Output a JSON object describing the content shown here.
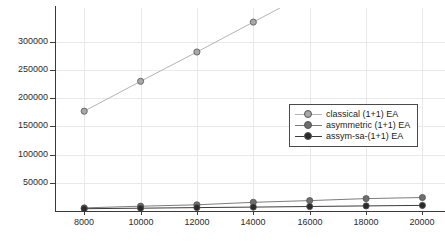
{
  "chart_data": {
    "type": "line",
    "title": "",
    "xlabel": "",
    "ylabel": "",
    "xlim": [
      7000,
      20800
    ],
    "ylim": [
      0,
      360000
    ],
    "xticks": [
      8000,
      10000,
      12000,
      14000,
      16000,
      18000,
      20000
    ],
    "yticks": [
      50000,
      100000,
      150000,
      200000,
      250000,
      300000
    ],
    "xtick_labels": [
      "8000",
      "10000",
      "12000",
      "14000",
      "16000",
      "18000",
      "20000"
    ],
    "ytick_labels": [
      "50000",
      "100000",
      "150000",
      "200000",
      "250000",
      "300000"
    ],
    "grid": true,
    "legend_position": "center-right",
    "series": [
      {
        "name": "classical (1+1) EA",
        "color": "#b4b4b4",
        "marker_color": "#a8a8a8",
        "clipped": true,
        "x": [
          8000,
          10000,
          12000,
          14000
        ],
        "values": [
          177000,
          230000,
          282000,
          335000
        ]
      },
      {
        "name": "asymmetric (1+1) EA",
        "color": "#7d7d7d",
        "marker_color": "#6e6e6e",
        "clipped": false,
        "x": [
          8000,
          10000,
          12000,
          14000,
          16000,
          18000,
          20000
        ],
        "values": [
          5500,
          8500,
          11000,
          15500,
          18500,
          22000,
          24000
        ]
      },
      {
        "name": "assym-sa-(1+1) EA",
        "color": "#3c3c3c",
        "marker_color": "#2a2a2a",
        "clipped": false,
        "x": [
          8000,
          10000,
          12000,
          14000,
          16000,
          18000,
          20000
        ],
        "values": [
          4000,
          5000,
          6000,
          7000,
          8000,
          9000,
          10000
        ]
      }
    ]
  },
  "legend": {
    "entries": [
      {
        "label": "classical (1+1) EA"
      },
      {
        "label": "asymmetric (1+1) EA"
      },
      {
        "label": "assym-sa-(1+1) EA"
      }
    ]
  },
  "colors": {
    "axis": "#3a3a3a",
    "grid": "#e9e9e9",
    "background": "#ffffff",
    "tick_text": "#2b2b2b"
  }
}
